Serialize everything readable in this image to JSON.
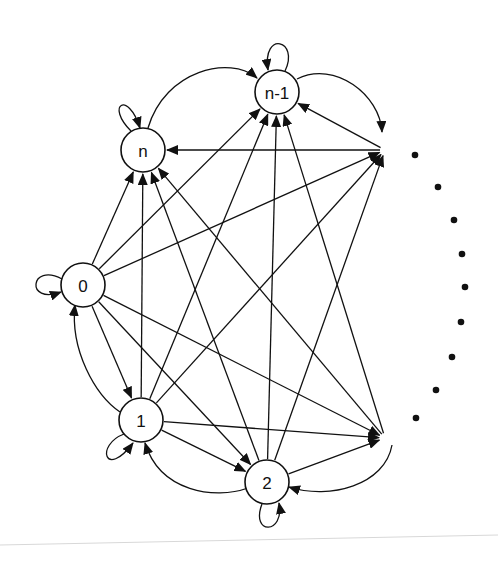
{
  "diagram": {
    "type": "state-transition-graph",
    "colors": {
      "stroke": "#111111",
      "background": "#ffffff",
      "node_fill": "#ffffff"
    },
    "nodes": [
      {
        "id": "n",
        "label": "n",
        "x": 143,
        "y": 150
      },
      {
        "id": "n-1",
        "label": "n-1",
        "x": 277,
        "y": 92
      },
      {
        "id": "0",
        "label": "0",
        "x": 83,
        "y": 285
      },
      {
        "id": "1",
        "label": "1",
        "x": 141,
        "y": 420
      },
      {
        "id": "2",
        "label": "2",
        "x": 267,
        "y": 482
      }
    ],
    "ellipsis_anchors": [
      {
        "id": "top-right",
        "x": 385,
        "y": 150
      },
      {
        "id": "bottom-right",
        "x": 385,
        "y": 438
      }
    ],
    "ellipsis_dots": [
      {
        "x": 415,
        "y": 155
      },
      {
        "x": 438,
        "y": 187
      },
      {
        "x": 454,
        "y": 220
      },
      {
        "x": 462,
        "y": 254
      },
      {
        "x": 465,
        "y": 287
      },
      {
        "x": 461,
        "y": 322
      },
      {
        "x": 452,
        "y": 357
      },
      {
        "x": 436,
        "y": 390
      },
      {
        "x": 416,
        "y": 418
      }
    ],
    "self_loops": [
      "n",
      "n-1",
      "0",
      "1",
      "2"
    ],
    "edges": [
      {
        "from": "0",
        "to": "n"
      },
      {
        "from": "0",
        "to": "n-1"
      },
      {
        "from": "0",
        "to": "top-right"
      },
      {
        "from": "0",
        "to": "1"
      },
      {
        "from": "0",
        "to": "2"
      },
      {
        "from": "0",
        "to": "bottom-right"
      },
      {
        "from": "1",
        "to": "n"
      },
      {
        "from": "1",
        "to": "n-1"
      },
      {
        "from": "1",
        "to": "top-right"
      },
      {
        "from": "1",
        "to": "2"
      },
      {
        "from": "1",
        "to": "bottom-right"
      },
      {
        "from": "1",
        "to": "0",
        "curved": true
      },
      {
        "from": "2",
        "to": "n"
      },
      {
        "from": "2",
        "to": "n-1"
      },
      {
        "from": "2",
        "to": "top-right"
      },
      {
        "from": "2",
        "to": "bottom-right"
      },
      {
        "from": "2",
        "to": "1",
        "curved": true
      },
      {
        "from": "top-right",
        "to": "n"
      },
      {
        "from": "top-right",
        "to": "n-1"
      },
      {
        "from": "bottom-right",
        "to": "n"
      },
      {
        "from": "bottom-right",
        "to": "n-1"
      },
      {
        "from": "n",
        "to": "n-1",
        "curved": true
      },
      {
        "from": "n-1",
        "to": "top-right",
        "curved": true
      },
      {
        "from": "bottom-right",
        "to": "2",
        "curved": true
      }
    ]
  }
}
